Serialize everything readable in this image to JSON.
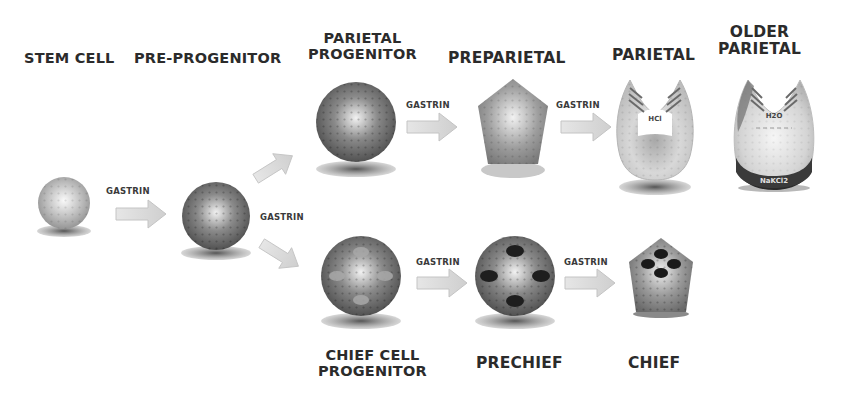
{
  "diagram": {
    "stages": {
      "stem_cell": "STEM CELL",
      "pre_progenitor": "PRE-PROGENITOR",
      "parietal_progenitor": [
        "PARIETAL",
        "PROGENITOR"
      ],
      "preparietal": "PREPARIETAL",
      "parietal": "PARIETAL",
      "older_parietal": [
        "OLDER",
        "PARIETAL"
      ],
      "chief_cell_progenitor": [
        "CHIEF CELL",
        "PROGENITOR"
      ],
      "prechief": "PRECHIEF",
      "chief": "CHIEF"
    },
    "arrow_label": "GASTRIN",
    "annotations": {
      "parietal_secretion": "HCl",
      "older_parietal_secretion": "H2O",
      "older_parietal_base": "NaKCl2"
    },
    "colors": {
      "label_text": "#2b2b2b",
      "arrow_fill": "#d9d9d9",
      "cell_dark": "#5a5a5a",
      "cell_light": "#eeeeee",
      "granule": "#1e1e1e"
    }
  }
}
